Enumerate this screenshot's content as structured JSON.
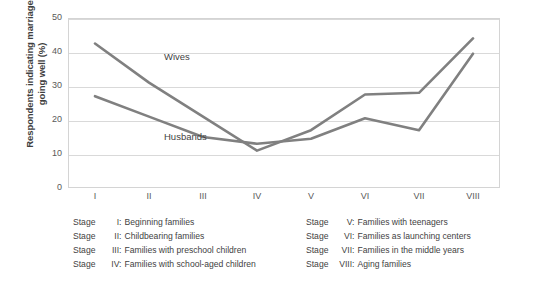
{
  "chart_data": {
    "type": "line",
    "title": "",
    "xlabel": "",
    "ylabel": "Respondents indicating marriage going well (%)",
    "categories": [
      "I",
      "II",
      "III",
      "IV",
      "V",
      "VI",
      "VII",
      "VIII"
    ],
    "ylim": [
      0,
      50
    ],
    "y_ticks": [
      "0",
      "10",
      "20",
      "30",
      "40",
      "50"
    ],
    "grid": true,
    "legend_position": "inline-labels",
    "line_color": "#808080",
    "gridline_color": "#d9d9d9",
    "series": [
      {
        "name": "Wives",
        "values": [
          42.5,
          31,
          21,
          11,
          17,
          27.5,
          28,
          44
        ]
      },
      {
        "name": "Husbands",
        "values": [
          27,
          21,
          15,
          13,
          14.5,
          20.5,
          17,
          39.5
        ]
      }
    ]
  },
  "axis": {
    "y_title": "Respondents indicating marriage going well (%)"
  },
  "series_labels": {
    "wives": "Wives",
    "husbands": "Husbands"
  },
  "legend": {
    "stage_word": "Stage",
    "left": [
      {
        "numeral": "I:",
        "description": "Beginning families"
      },
      {
        "numeral": "II:",
        "description": "Childbearing families"
      },
      {
        "numeral": "III:",
        "description": "Families with preschool children"
      },
      {
        "numeral": "IV:",
        "description": "Families with school-aged children"
      }
    ],
    "right": [
      {
        "numeral": "V:",
        "description": "Families with teenagers"
      },
      {
        "numeral": "VI:",
        "description": "Families as launching centers"
      },
      {
        "numeral": "VII:",
        "description": "Families in the middle years"
      },
      {
        "numeral": "VIII:",
        "description": "Aging families"
      }
    ]
  }
}
